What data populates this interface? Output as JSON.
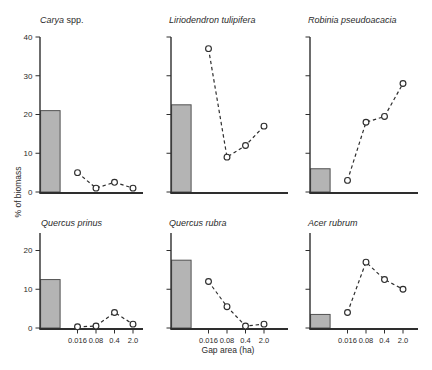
{
  "figure": {
    "ylabel": "% of biomass",
    "xlabel": "Gap area (ha)",
    "background": "#ffffff",
    "axis_color": "#2e2e2e",
    "text_color": "#2b2b2b",
    "bar_fill": "#b4b4b4",
    "bar_stroke": "#525252",
    "line_color": "#2e2e2e",
    "marker_fill": "#ffffff"
  },
  "chart_data": [
    {
      "type": "bar+line",
      "panel": "top-left",
      "title_italic": "Carya",
      "title_suffix": " spp.",
      "x_categories": [
        "0.016",
        "0.08",
        "0.4",
        "2.0"
      ],
      "bar_value": 21,
      "line_values": [
        5,
        1,
        2.5,
        1
      ],
      "ylim": [
        0,
        40
      ],
      "yticks": [
        0,
        10,
        20,
        30,
        40
      ],
      "ytick_labels_visible": true,
      "xtick_labels_visible": false
    },
    {
      "type": "bar+line",
      "panel": "top-center",
      "title_italic": "Liriodendron tulipifera",
      "title_suffix": "",
      "x_categories": [
        "0.016",
        "0.08",
        "0.4",
        "2.0"
      ],
      "bar_value": 22.5,
      "line_values": [
        37,
        9,
        12,
        17
      ],
      "ylim": [
        0,
        40
      ],
      "yticks": [
        0,
        10,
        20,
        30,
        40
      ],
      "ytick_labels_visible": false,
      "xtick_labels_visible": false
    },
    {
      "type": "bar+line",
      "panel": "top-right",
      "title_italic": "Robinia pseudoacacia",
      "title_suffix": "",
      "x_categories": [
        "0.016",
        "0.08",
        "0.4",
        "2.0"
      ],
      "bar_value": 6,
      "line_values": [
        3,
        18,
        19.5,
        28
      ],
      "ylim": [
        0,
        40
      ],
      "yticks": [
        0,
        10,
        20,
        30,
        40
      ],
      "ytick_labels_visible": false,
      "xtick_labels_visible": false
    },
    {
      "type": "bar+line",
      "panel": "bottom-left",
      "title_italic": "Quercus prinus",
      "title_suffix": "",
      "x_categories": [
        "0.016",
        "0.08",
        "0.4",
        "2.0"
      ],
      "bar_value": 12.5,
      "line_values": [
        0.3,
        0.5,
        4,
        1
      ],
      "ylim": [
        0,
        24.5
      ],
      "yticks": [
        0,
        10,
        20
      ],
      "ytick_labels_visible": true,
      "xtick_labels_visible": true
    },
    {
      "type": "bar+line",
      "panel": "bottom-center",
      "title_italic": "Quercus rubra",
      "title_suffix": "",
      "x_categories": [
        "0.016",
        "0.08",
        "0.4",
        "2.0"
      ],
      "bar_value": 17.5,
      "line_values": [
        12,
        5.5,
        0.5,
        1
      ],
      "ylim": [
        0,
        24.5
      ],
      "yticks": [
        0,
        10,
        20
      ],
      "ytick_labels_visible": false,
      "xtick_labels_visible": true
    },
    {
      "type": "bar+line",
      "panel": "bottom-right",
      "title_italic": "Acer rubrum",
      "title_suffix": "",
      "x_categories": [
        "0.016",
        "0.08",
        "0.4",
        "2.0"
      ],
      "bar_value": 3.5,
      "line_values": [
        4,
        17,
        12.5,
        10
      ],
      "ylim": [
        0,
        24.5
      ],
      "yticks": [
        0,
        10,
        20
      ],
      "ytick_labels_visible": false,
      "xtick_labels_visible": true
    }
  ]
}
